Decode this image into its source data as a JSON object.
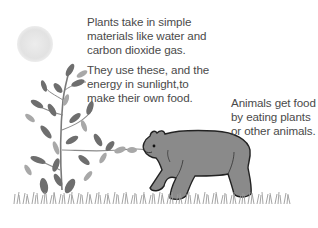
{
  "diagram": {
    "captions": {
      "plants_materials": {
        "lines": [
          "Plants take in simple",
          "materials like water and",
          "carbon dioxide gas."
        ]
      },
      "plants_energy": {
        "lines": [
          "They use these, and the",
          "energy in sunlight,to",
          "make their own food."
        ]
      },
      "animals": {
        "lines": [
          "Animals get food",
          "by eating plants",
          "or other animals."
        ]
      }
    },
    "elements": {
      "sun": "sun-icon",
      "plant": "plant-illustration",
      "bear": "bear-illustration",
      "grass": "grass-strip"
    },
    "colors": {
      "text": "#4a4a4a",
      "sun": "#e6e6e6",
      "leaf_dark": "#6e6e6e",
      "leaf_light": "#a8a8a8",
      "bear_fill": "#8a8a8a",
      "bear_outline": "#222222",
      "grass": "#9a9a9a"
    }
  }
}
